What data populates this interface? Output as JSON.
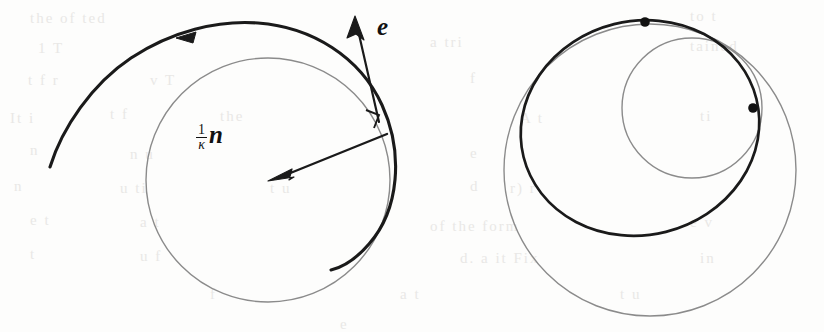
{
  "figure": {
    "caption_labels": {
      "normal_vector": {
        "numerator": "1",
        "denominator": "κ",
        "vector": "n"
      },
      "tangent_vector": {
        "vector": "e"
      }
    },
    "colors": {
      "curve_dark": "#1a1a1a",
      "circle_gray": "#8b8b8b",
      "background": "#fdfdfc",
      "bleed_text": "#e9e8e6",
      "marker_dot": "#111111"
    },
    "left_panel": {
      "name": "osculating-circle-diagram",
      "osculating_circle": {
        "cx": 268,
        "cy": 180,
        "r": 122,
        "stroke": "#8b8b8b",
        "stroke_width": 1.4
      },
      "spiral_curve": {
        "stroke": "#1a1a1a",
        "stroke_width": 3.0
      },
      "direction_arrow_on_curve": {
        "x": 185,
        "y": 38
      },
      "normal_arrow": {
        "from_x": 386,
        "from_y": 135,
        "to_x": 272,
        "to_y": 180
      },
      "tangent_arrow": {
        "from_x": 378,
        "from_y": 120,
        "to_x": 356,
        "to_y": 22
      },
      "right_angle_marker": {
        "x": 371,
        "y": 120,
        "size": 13
      }
    },
    "right_panel": {
      "name": "evolute-circles-diagram",
      "large_gray_circle": {
        "cx": 650,
        "cy": 170,
        "r": 146,
        "stroke": "#8b8b8b",
        "stroke_width": 1.4
      },
      "small_gray_circle": {
        "cx": 692,
        "cy": 108,
        "r": 70,
        "stroke": "#8b8b8b",
        "stroke_width": 1.4
      },
      "dark_oval": {
        "cx": 640,
        "cy": 128,
        "rx": 120,
        "ry": 114,
        "rotation": -12,
        "stroke": "#1a1a1a",
        "stroke_width": 2.6
      },
      "markers": [
        {
          "name": "marker-dot-top",
          "cx": 645,
          "cy": 22,
          "r": 4.6
        },
        {
          "name": "marker-dot-right",
          "cx": 753,
          "cy": 108,
          "r": 4.6
        }
      ]
    },
    "bleed_text_lines": [
      {
        "text": "the    of     ted",
        "x": 30,
        "y": 10
      },
      {
        "text": "to   t",
        "x": 690,
        "y": 8
      },
      {
        "text": "1  T",
        "x": 38,
        "y": 40
      },
      {
        "text": "a  tri",
        "x": 430,
        "y": 34
      },
      {
        "text": "tained",
        "x": 690,
        "y": 38
      },
      {
        "text": "t   f   r",
        "x": 28,
        "y": 72
      },
      {
        "text": "v  T",
        "x": 150,
        "y": 72
      },
      {
        "text": "f",
        "x": 470,
        "y": 70
      },
      {
        "text": "It  i",
        "x": 10,
        "y": 110
      },
      {
        "text": "t  f",
        "x": 110,
        "y": 106
      },
      {
        "text": "the",
        "x": 220,
        "y": 108
      },
      {
        "text": "A  t",
        "x": 520,
        "y": 110
      },
      {
        "text": "ti",
        "x": 700,
        "y": 108
      },
      {
        "text": "n",
        "x": 30,
        "y": 142
      },
      {
        "text": "n   u",
        "x": 130,
        "y": 146
      },
      {
        "text": "e",
        "x": 470,
        "y": 145
      },
      {
        "text": "n",
        "x": 14,
        "y": 178
      },
      {
        "text": "u  ti",
        "x": 120,
        "y": 180
      },
      {
        "text": "t  u",
        "x": 270,
        "y": 180
      },
      {
        "text": "d",
        "x": 470,
        "y": 178
      },
      {
        "text": "r)   r",
        "x": 510,
        "y": 180
      },
      {
        "text": "e   t",
        "x": 30,
        "y": 212
      },
      {
        "text": "a  t",
        "x": 140,
        "y": 214
      },
      {
        "text": "of the  form",
        "x": 430,
        "y": 218
      },
      {
        "text": "e   v",
        "x": 690,
        "y": 214
      },
      {
        "text": "t",
        "x": 30,
        "y": 246
      },
      {
        "text": "u   f",
        "x": 140,
        "y": 248
      },
      {
        "text": "d. a  it  Fix",
        "x": 460,
        "y": 250
      },
      {
        "text": "in",
        "x": 700,
        "y": 250
      },
      {
        "text": "f",
        "x": 210,
        "y": 286
      },
      {
        "text": "a  t",
        "x": 400,
        "y": 286
      },
      {
        "text": "t  u",
        "x": 620,
        "y": 286
      },
      {
        "text": "e",
        "x": 340,
        "y": 316
      }
    ]
  }
}
